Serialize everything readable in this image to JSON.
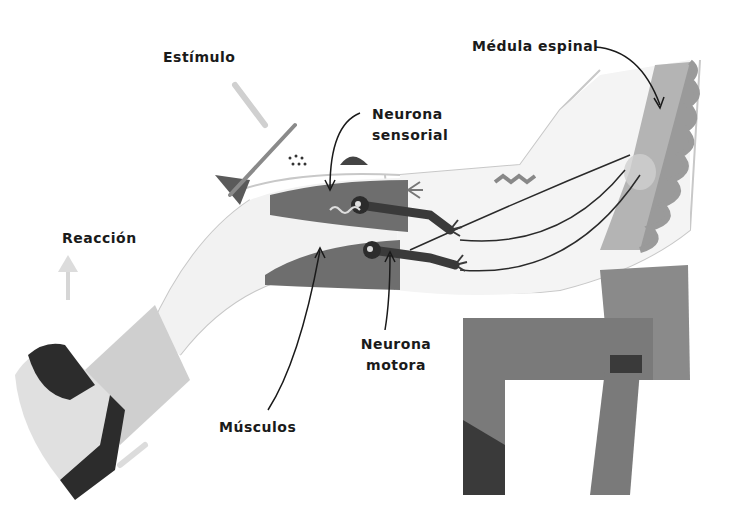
{
  "diagram": {
    "labels": {
      "estimulo": "Estímulo",
      "medula": "Médula espinal",
      "neurona_sensorial_1": "Neurona",
      "neurona_sensorial_2": "sensorial",
      "reaccion": "Reacción",
      "neurona_motora_1": "Neurona",
      "neurona_motora_2": "motora",
      "musculos": "Músculos"
    },
    "colors": {
      "ink": "#1a1a1a",
      "muscle": "#6e6e6e",
      "muscle_light": "#a9a9a9",
      "spine": "#b4b4b4",
      "vertebra": "#9a9a9a",
      "skin_outline": "#c8c8c8",
      "chair": "#7a7a7a",
      "chair_dark": "#3a3a3a",
      "shoe": "#e0e0e0",
      "shoe_dark": "#2c2c2c"
    }
  }
}
